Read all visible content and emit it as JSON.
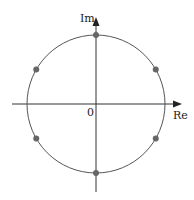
{
  "diagram": {
    "title": "",
    "axes": {
      "x_label": "Re",
      "y_label": "Im",
      "origin_label": "0"
    },
    "circle": {
      "cx": 96,
      "cy": 104,
      "r": 69,
      "stroke": "#555555"
    },
    "points_color": "#666666",
    "points": [
      {
        "angle_deg": 90
      },
      {
        "angle_deg": 30
      },
      {
        "angle_deg": -30
      },
      {
        "angle_deg": -90
      },
      {
        "angle_deg": 210
      },
      {
        "angle_deg": 150
      }
    ]
  }
}
